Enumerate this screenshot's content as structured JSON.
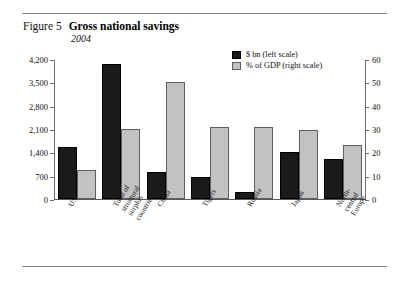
{
  "figure": {
    "number": "Figure 5",
    "title": "Gross national savings",
    "subtitle": "2004"
  },
  "legend": {
    "position": "top-right",
    "entries": [
      {
        "label": "$ bn (left scale)",
        "color": "#1a1a1a",
        "icon": "legend-swatch-dark"
      },
      {
        "label": "% of GDP (right scale)",
        "color": "#c2c2c2",
        "icon": "legend-swatch-light"
      }
    ]
  },
  "chart_data": {
    "type": "bar",
    "title": "Gross national savings",
    "subtitle": "2004",
    "xlabel": "",
    "ylabel": "",
    "grid": false,
    "legend_position": "top-right",
    "categories": [
      "US",
      "Total of structural\nsurplus countries",
      "China",
      "Tigers",
      "Russia",
      "Japan",
      "North-central\nEurope"
    ],
    "series": [
      {
        "name": "$ bn (left scale)",
        "axis": "left",
        "color": "#1a1a1a",
        "values": [
          1550,
          4050,
          800,
          650,
          200,
          1400,
          1200
        ]
      },
      {
        "name": "% of GDP (right scale)",
        "axis": "right",
        "color": "#c2c2c2",
        "values": [
          12.4,
          30,
          50,
          31,
          31,
          29.5,
          23
        ]
      }
    ],
    "left_axis": {
      "label": "$ bn",
      "ticks": [
        "0",
        "700",
        "1,400",
        "2,100",
        "2,800",
        "3,500",
        "4,200"
      ],
      "tick_values": [
        0,
        700,
        1400,
        2100,
        2800,
        3500,
        4200
      ],
      "ylim": [
        0,
        4200
      ]
    },
    "right_axis": {
      "label": "% of GDP",
      "ticks": [
        "0",
        "10",
        "20",
        "30",
        "40",
        "50",
        "60"
      ],
      "tick_values": [
        0,
        10,
        20,
        30,
        40,
        50,
        60
      ],
      "ylim": [
        0,
        60
      ]
    }
  }
}
